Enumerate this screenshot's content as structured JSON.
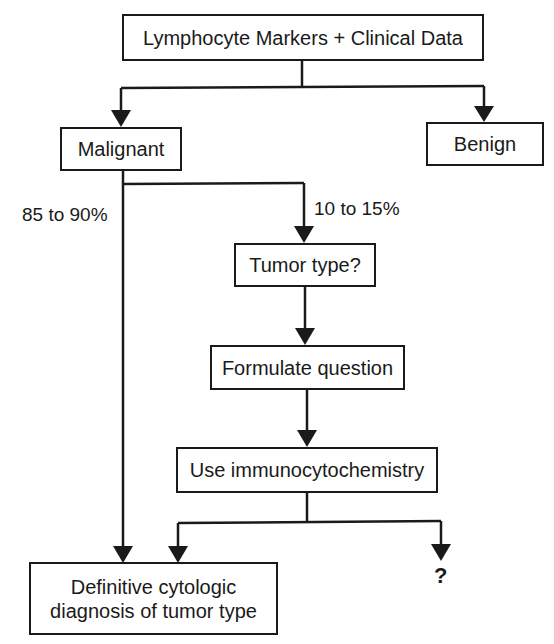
{
  "diagram": {
    "type": "flowchart",
    "nodes": {
      "root": "Lymphocyte Markers + Clinical Data",
      "malignant": "Malignant",
      "benign": "Benign",
      "tumor_type": "Tumor type?",
      "formulate": "Formulate question",
      "immuno": "Use immunocytochemistry",
      "definitive_line1": "Definitive cytologic",
      "definitive_line2": "diagnosis of tumor type",
      "unknown": "?"
    },
    "edge_labels": {
      "majority": "85 to 90%",
      "minority": "10 to 15%"
    },
    "edges": [
      {
        "from": "root",
        "to": "malignant"
      },
      {
        "from": "root",
        "to": "benign"
      },
      {
        "from": "malignant",
        "to": "definitive",
        "label": "85 to 90%"
      },
      {
        "from": "malignant",
        "to": "tumor_type",
        "label": "10 to 15%"
      },
      {
        "from": "tumor_type",
        "to": "formulate"
      },
      {
        "from": "formulate",
        "to": "immuno"
      },
      {
        "from": "immuno",
        "to": "definitive"
      },
      {
        "from": "immuno",
        "to": "unknown"
      }
    ],
    "colors": {
      "line": "#1a1a1a",
      "background": "#ffffff"
    }
  }
}
